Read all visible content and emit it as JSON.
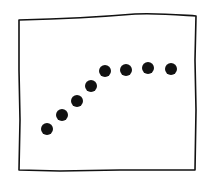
{
  "chart_data": {
    "type": "scatter",
    "title": "",
    "xlabel": "",
    "ylabel": "",
    "grid": false,
    "legend": null,
    "points_px": [
      {
        "x": 47,
        "y": 129
      },
      {
        "x": 62,
        "y": 115
      },
      {
        "x": 77,
        "y": 101
      },
      {
        "x": 91,
        "y": 86
      },
      {
        "x": 105,
        "y": 71
      },
      {
        "x": 126,
        "y": 70
      },
      {
        "x": 148,
        "y": 68
      },
      {
        "x": 171,
        "y": 69
      }
    ],
    "x": [
      1,
      2,
      3,
      4,
      5,
      6,
      7,
      8
    ],
    "values": [
      1,
      2,
      3,
      4,
      5,
      5.05,
      5.15,
      5.1
    ]
  },
  "style": {
    "ink": "#111111",
    "background": "#ffffff",
    "dot_radius": 6
  }
}
